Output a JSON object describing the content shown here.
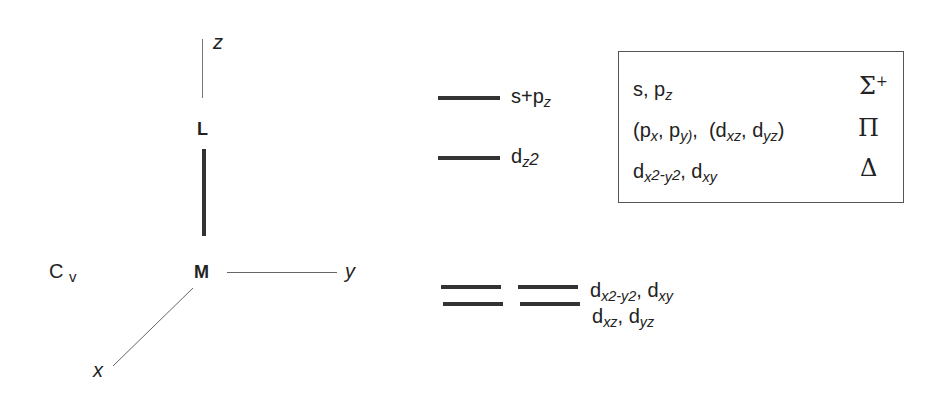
{
  "coordinate_system": {
    "axes": {
      "z": "z",
      "y": "y",
      "x": "x"
    },
    "atoms": {
      "ligand": "L",
      "metal": "M"
    },
    "point_group": {
      "main": "C",
      "sub": "∞v"
    }
  },
  "levels": [
    {
      "label_main": "s+p",
      "label_sub": "z",
      "degeneracy": 1
    },
    {
      "label_main": "d",
      "label_sub": "z2",
      "degeneracy": 1
    },
    {
      "line1_a": "d",
      "line1_a_sub": "x2-y2",
      "line1_b": ", d",
      "line1_b_sub": "xy",
      "line2_a": "d",
      "line2_a_sub": "xz",
      "line2_b": ", d",
      "line2_b_sub": "yz",
      "degeneracy": 4
    }
  ],
  "symmetry_table": {
    "rows": [
      {
        "orbitals_html_parts": [
          "s, p",
          "z"
        ],
        "symmetry": "Σ",
        "sup": "+"
      },
      {
        "orbitals_text": "(px, py), (dxz, dyz)",
        "symmetry": "Π"
      },
      {
        "orbitals_text": "dx2-y2, dxy",
        "symmetry": "Δ"
      }
    ]
  }
}
